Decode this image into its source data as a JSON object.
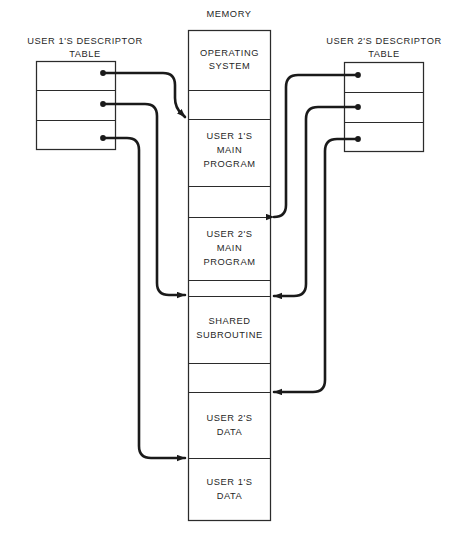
{
  "diagram": {
    "title_memory": "MEMORY",
    "left_table": {
      "caption_line1": "USER 1'S DESCRIPTOR",
      "caption_line2": "TABLE",
      "rows": [
        {
          "name": "user1-descriptor-row-1"
        },
        {
          "name": "user1-descriptor-row-2"
        },
        {
          "name": "user1-descriptor-row-3"
        }
      ]
    },
    "right_table": {
      "caption_line1": "USER 2'S DESCRIPTOR",
      "caption_line2": "TABLE",
      "rows": [
        {
          "name": "user2-descriptor-row-1"
        },
        {
          "name": "user2-descriptor-row-2"
        },
        {
          "name": "user2-descriptor-row-3"
        }
      ]
    },
    "memory_segments": [
      {
        "line1": "OPERATING",
        "line2": "SYSTEM",
        "line3": ""
      },
      {
        "line1": "",
        "line2": "",
        "line3": ""
      },
      {
        "line1": "USER 1'S",
        "line2": "MAIN",
        "line3": "PROGRAM"
      },
      {
        "line1": "",
        "line2": "",
        "line3": ""
      },
      {
        "line1": "USER 2'S",
        "line2": "MAIN",
        "line3": "PROGRAM"
      },
      {
        "line1": "",
        "line2": "",
        "line3": ""
      },
      {
        "line1": "SHARED",
        "line2": "SUBROUTINE",
        "line3": ""
      },
      {
        "line1": "",
        "line2": "",
        "line3": ""
      },
      {
        "line1": "USER 2'S",
        "line2": "DATA",
        "line3": ""
      },
      {
        "line1": "USER 1'S",
        "line2": "DATA",
        "line3": ""
      }
    ],
    "colors": {
      "line": "#2b2b2b",
      "connector": "#1a1a1a",
      "text": "#1f1f1f",
      "background": "#ffffff"
    }
  }
}
